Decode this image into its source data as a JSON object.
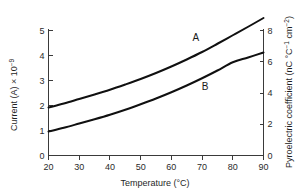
{
  "chart_data": {
    "type": "line",
    "title": "",
    "xlabel": "Temperature (°C)",
    "ylabel": "Current (A) × 10",
    "ylabel_exponent": "−9",
    "ylabel_right": "Pyroelectric coefficient (nC °C",
    "ylabel_right_exp1": "−1",
    "ylabel_right_mid": " cm",
    "ylabel_right_exp2": "−2",
    "ylabel_right_end": ")",
    "xlim": [
      20,
      90
    ],
    "ylim": [
      0,
      5
    ],
    "ylim_right": [
      0,
      8
    ],
    "xticks": [
      20,
      30,
      40,
      50,
      60,
      70,
      80,
      90
    ],
    "xtick_labels": [
      "20",
      "30",
      "40",
      "50",
      "60",
      "70",
      "80",
      "90"
    ],
    "yticks": [
      0,
      1,
      2,
      3,
      4,
      5
    ],
    "ytick_labels": [
      "0",
      "1",
      "2",
      "3",
      "4",
      "5"
    ],
    "yticks_right": [
      0,
      2,
      4,
      6,
      8
    ],
    "ytick_labels_right": [
      "0",
      "2",
      "4",
      "6",
      "8"
    ],
    "grid": false,
    "legend_position": "inline-annotation",
    "series": [
      {
        "name": "A",
        "label": "A",
        "label_x": 68,
        "label_y": 4.6,
        "color": "#101010",
        "x": [
          20,
          25,
          30,
          35,
          40,
          45,
          50,
          55,
          60,
          65,
          70,
          75,
          80,
          85,
          90
        ],
        "values": [
          1.92,
          2.08,
          2.26,
          2.44,
          2.63,
          2.84,
          3.06,
          3.3,
          3.56,
          3.84,
          4.14,
          4.47,
          4.81,
          5.15,
          5.5
        ],
        "values_right": [
          2.8,
          3.03,
          3.29,
          3.55,
          3.83,
          4.13,
          4.45,
          4.8,
          5.18,
          5.59,
          6.02,
          6.5,
          7.0,
          7.49,
          8.0
        ]
      },
      {
        "name": "B",
        "label": "B",
        "label_x": 71,
        "label_y": 2.64,
        "color": "#101010",
        "x": [
          20,
          25,
          30,
          35,
          40,
          45,
          50,
          55,
          60,
          65,
          70,
          75,
          80,
          85,
          90
        ],
        "values": [
          0.96,
          1.11,
          1.28,
          1.45,
          1.63,
          1.83,
          2.05,
          2.28,
          2.53,
          2.8,
          3.09,
          3.4,
          3.73,
          3.92,
          4.12
        ],
        "values_right": [
          1.4,
          1.62,
          1.86,
          2.11,
          2.37,
          2.66,
          2.98,
          3.32,
          3.68,
          4.07,
          4.49,
          4.95,
          5.43,
          5.7,
          6.0
        ]
      }
    ]
  },
  "figure": {
    "background_color": "#ffffff",
    "axis_color": "#3a3a3a",
    "curve_color": "#101010"
  }
}
